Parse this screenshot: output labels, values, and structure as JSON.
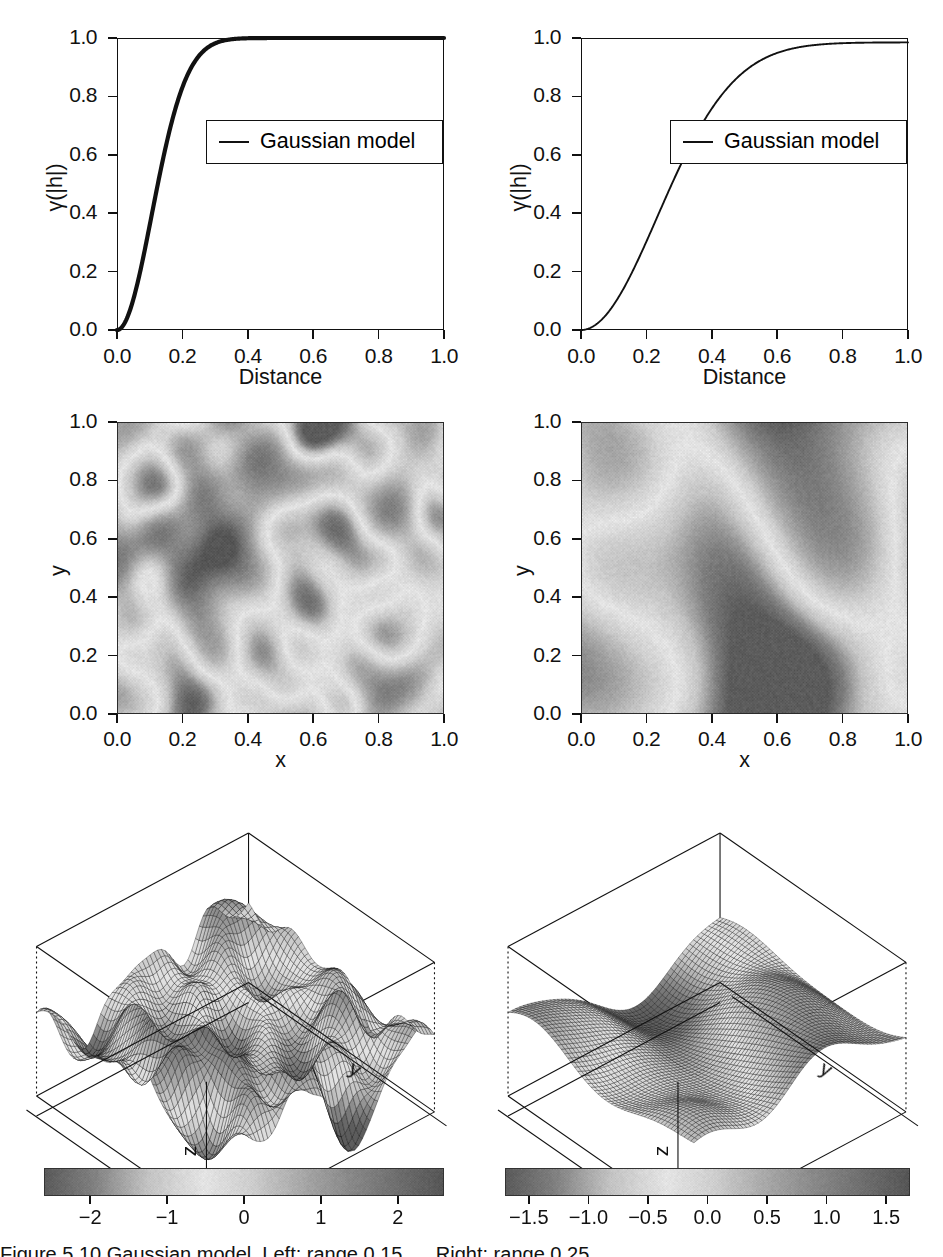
{
  "figure": {
    "kind": "multi-panel-figure",
    "caption_fragment": "Figure 5.10  Gaussian model. Left: range 0.15 ..., Right: range 0.25 ...",
    "columns": [
      {
        "name": "left-column",
        "label": "short range"
      },
      {
        "name": "right-column",
        "label": "long range"
      }
    ]
  },
  "panels": {
    "variogram_left": {
      "legend_label": "Gaussian model",
      "xlabel": "Distance",
      "ylabel": "γ(|h|)",
      "xticks": [
        "0.0",
        "0.2",
        "0.4",
        "0.6",
        "0.8",
        "1.0"
      ],
      "yticks": [
        "0.0",
        "0.2",
        "0.4",
        "0.6",
        "0.8",
        "1.0"
      ]
    },
    "variogram_right": {
      "legend_label": "Gaussian model",
      "xlabel": "Distance",
      "ylabel": "γ(|h|)",
      "xticks": [
        "0.0",
        "0.2",
        "0.4",
        "0.6",
        "0.8",
        "1.0"
      ],
      "yticks": [
        "0.0",
        "0.2",
        "0.4",
        "0.6",
        "0.8",
        "1.0"
      ]
    },
    "heatmap_left": {
      "xlabel": "x",
      "ylabel": "y",
      "xticks": [
        "0.0",
        "0.2",
        "0.4",
        "0.6",
        "0.8",
        "1.0"
      ],
      "yticks": [
        "0.0",
        "0.2",
        "0.4",
        "0.6",
        "0.8",
        "1.0"
      ]
    },
    "heatmap_right": {
      "xlabel": "x",
      "ylabel": "y",
      "xticks": [
        "0.0",
        "0.2",
        "0.4",
        "0.6",
        "0.8",
        "1.0"
      ],
      "yticks": [
        "0.0",
        "0.2",
        "0.4",
        "0.6",
        "0.8",
        "1.0"
      ]
    },
    "surface_left": {
      "xlabel": "x",
      "ylabel": "y",
      "zlabel": "z",
      "colorbar_ticks": [
        "−2",
        "−1",
        "0",
        "1",
        "2"
      ]
    },
    "surface_right": {
      "xlabel": "x",
      "ylabel": "y",
      "zlabel": "z",
      "colorbar_ticks": [
        "−1.5",
        "−1.0",
        "−0.5",
        "0.0",
        "0.5",
        "1.0",
        "1.5"
      ]
    }
  },
  "chart_data": [
    {
      "type": "line",
      "name": "variogram_left",
      "title": "",
      "xlabel": "Distance",
      "ylabel": "γ(|h|)",
      "xlim": [
        0.0,
        1.0
      ],
      "ylim": [
        0.0,
        1.0
      ],
      "grid": false,
      "legend": [
        "Gaussian model"
      ],
      "legend_position": "center-right",
      "model": "gaussian",
      "sill": 1.0,
      "nugget": 0.0,
      "range": 0.15,
      "x": [
        0.0,
        0.02,
        0.04,
        0.06,
        0.08,
        0.1,
        0.12,
        0.14,
        0.16,
        0.18,
        0.2,
        0.25,
        0.3,
        0.4,
        0.5,
        0.6,
        0.7,
        0.8,
        0.9,
        1.0
      ],
      "y": [
        0.0,
        0.053,
        0.199,
        0.393,
        0.59,
        0.75,
        0.86,
        0.929,
        0.966,
        0.985,
        0.993,
        0.9995,
        1.0,
        1.0,
        1.0,
        1.0,
        1.0,
        1.0,
        1.0,
        1.0
      ]
    },
    {
      "type": "line",
      "name": "variogram_right",
      "title": "",
      "xlabel": "Distance",
      "ylabel": "γ(|h|)",
      "xlim": [
        0.0,
        1.0
      ],
      "ylim": [
        0.0,
        1.0
      ],
      "grid": false,
      "legend": [
        "Gaussian model"
      ],
      "legend_position": "center-right",
      "model": "gaussian",
      "sill": 0.985,
      "nugget": 0.0,
      "range": 0.33,
      "x": [
        0.0,
        0.05,
        0.1,
        0.15,
        0.2,
        0.25,
        0.3,
        0.35,
        0.4,
        0.45,
        0.5,
        0.55,
        0.6,
        0.7,
        0.8,
        0.9,
        1.0
      ],
      "y": [
        0.0,
        0.022,
        0.087,
        0.187,
        0.31,
        0.44,
        0.566,
        0.678,
        0.771,
        0.843,
        0.896,
        0.932,
        0.955,
        0.977,
        0.983,
        0.985,
        0.985
      ]
    },
    {
      "type": "heatmap",
      "name": "heatmap_left",
      "xlabel": "x",
      "ylabel": "y",
      "xlim": [
        0.0,
        1.0
      ],
      "ylim": [
        0.0,
        1.0
      ],
      "colormap": "terrain-gray",
      "value_range": [
        -2.6,
        2.6
      ],
      "correlation_range": 0.09
    },
    {
      "type": "heatmap",
      "name": "heatmap_right",
      "xlabel": "x",
      "ylabel": "y",
      "xlim": [
        0.0,
        1.0
      ],
      "ylim": [
        0.0,
        1.0
      ],
      "colormap": "terrain-gray",
      "value_range": [
        -1.7,
        1.7
      ],
      "correlation_range": 0.24
    },
    {
      "type": "surface",
      "name": "surface_left",
      "xlabel": "x",
      "ylabel": "y",
      "zlabel": "z",
      "colorbar_range": [
        -2.6,
        2.6
      ],
      "colorbar_ticks": [
        -2,
        -1,
        0,
        1,
        2
      ],
      "correlation_range": 0.09
    },
    {
      "type": "surface",
      "name": "surface_right",
      "xlabel": "x",
      "ylabel": "y",
      "zlabel": "z",
      "colorbar_range": [
        -1.7,
        1.7
      ],
      "colorbar_ticks": [
        -1.5,
        -1.0,
        -0.5,
        0.0,
        0.5,
        1.0,
        1.5
      ],
      "correlation_range": 0.24
    }
  ]
}
